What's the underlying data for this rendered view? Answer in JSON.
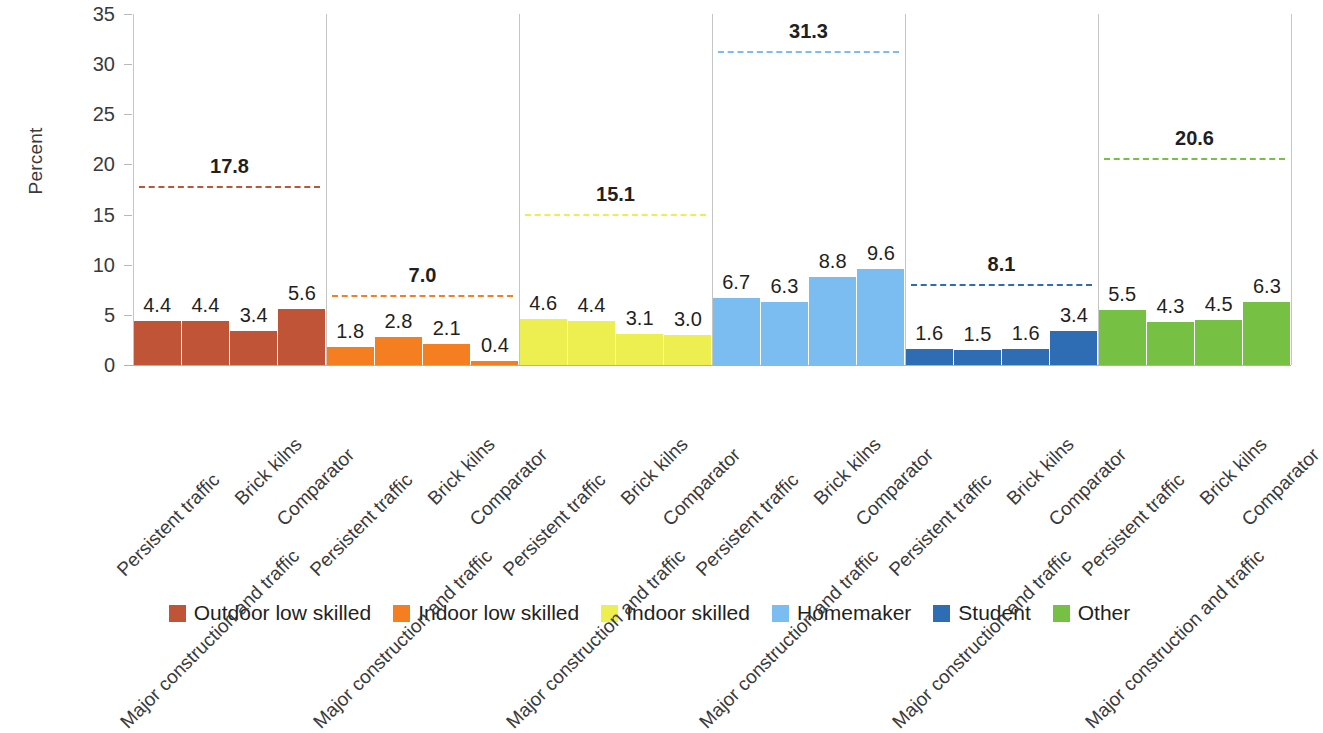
{
  "chart_data": {
    "type": "bar",
    "title": "",
    "subtitle": "",
    "xlabel": "",
    "ylabel": "Percent",
    "ylim": [
      0,
      35
    ],
    "yticks": [
      0,
      5,
      10,
      15,
      20,
      25,
      30,
      35
    ],
    "ytick_labels": [
      "0",
      "5",
      "10",
      "15",
      "20",
      "25",
      "30",
      "35"
    ],
    "grid": false,
    "legend_position": "bottom",
    "categories": [
      "Persistent traffic",
      "Major construction and traffic",
      "Brick kilns",
      "Comparator"
    ],
    "panels": [
      {
        "name": "Outdoor low skilled",
        "color": "#BF5536",
        "reference_line": 17.8,
        "reference_label": "17.8",
        "values": [
          4.4,
          4.4,
          3.4,
          5.6
        ],
        "value_labels": [
          "4.4",
          "4.4",
          "3.4",
          "5.6"
        ]
      },
      {
        "name": "Indoor low skilled",
        "color": "#F57F20",
        "reference_line": 7.0,
        "reference_label": "7.0",
        "values": [
          1.8,
          2.8,
          2.1,
          0.4
        ],
        "value_labels": [
          "1.8",
          "2.8",
          "2.1",
          "0.4"
        ]
      },
      {
        "name": "Indoor skilled",
        "color": "#EDEF50",
        "reference_line": 15.1,
        "reference_label": "15.1",
        "values": [
          4.6,
          4.4,
          3.1,
          3.0
        ],
        "value_labels": [
          "4.6",
          "4.4",
          "3.1",
          "3.0"
        ]
      },
      {
        "name": "Homemaker",
        "color": "#7BBDF0",
        "reference_line": 31.3,
        "reference_label": "31.3",
        "values": [
          6.7,
          6.3,
          8.8,
          9.6
        ],
        "value_labels": [
          "6.7",
          "6.3",
          "8.8",
          "9.6"
        ]
      },
      {
        "name": "Student",
        "color": "#2E6DB4",
        "reference_line": 8.1,
        "reference_label": "8.1",
        "values": [
          1.6,
          1.5,
          1.6,
          3.4
        ],
        "value_labels": [
          "1.6",
          "1.5",
          "1.6",
          "3.4"
        ]
      },
      {
        "name": "Other",
        "color": "#76C043",
        "reference_line": 20.6,
        "reference_label": "20.6",
        "values": [
          5.5,
          4.3,
          4.5,
          6.3
        ],
        "value_labels": [
          "5.5",
          "4.3",
          "4.5",
          "6.3"
        ]
      }
    ],
    "legend": [
      {
        "label": "Outdoor low skilled",
        "color": "#BF5536"
      },
      {
        "label": "Indoor low skilled",
        "color": "#F57F20"
      },
      {
        "label": "Indoor skilled",
        "color": "#EDEF50"
      },
      {
        "label": "Homemaker",
        "color": "#7BBDF0"
      },
      {
        "label": "Student",
        "color": "#2E6DB4"
      },
      {
        "label": "Other",
        "color": "#76C043"
      }
    ]
  }
}
